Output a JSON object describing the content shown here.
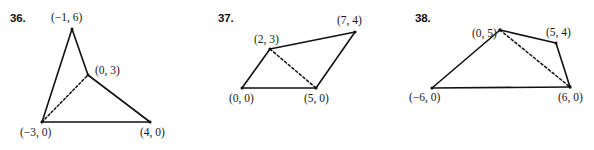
{
  "page": {
    "background_color": "#ffffff",
    "stroke_color": "#111111",
    "text_color": "#1a1a1a",
    "width": 594,
    "height": 150
  },
  "figures": [
    {
      "id": "figure-36",
      "number": "36.",
      "number_pos": {
        "x": 10,
        "y": 13
      },
      "shape": "triangle-with-cevian",
      "vertices": [
        {
          "name": "(-1, 6)",
          "label": "(−1, 6)",
          "px": 72,
          "py": 29,
          "label_x": 51,
          "label_y": 12
        },
        {
          "name": "(0, 3)",
          "label": "(0, 3)",
          "px": 88,
          "py": 75,
          "label_x": 95,
          "label_y": 65
        },
        {
          "name": "(4, 0)",
          "label": "(4, 0)",
          "px": 150,
          "py": 122,
          "label_x": 140,
          "label_y": 127
        },
        {
          "name": "(-3, 0)",
          "label": "(−3, 0)",
          "px": 42,
          "py": 122,
          "label_x": 20,
          "label_y": 127
        }
      ],
      "solid_edges": [
        [
          0,
          1
        ],
        [
          1,
          2
        ],
        [
          2,
          3
        ],
        [
          3,
          0
        ]
      ],
      "dashed_edges": [
        [
          3,
          1
        ]
      ]
    },
    {
      "id": "figure-37",
      "number": "37.",
      "number_pos": {
        "x": 218,
        "y": 13
      },
      "shape": "quadrilateral-with-diagonal",
      "vertices": [
        {
          "name": "(2, 3)",
          "label": "(2, 3)",
          "px": 270,
          "py": 49,
          "label_x": 254,
          "label_y": 34
        },
        {
          "name": "(7, 4)",
          "label": "(7, 4)",
          "px": 355,
          "py": 32,
          "label_x": 337,
          "label_y": 15
        },
        {
          "name": "(5, 0)",
          "label": "(5, 0)",
          "px": 316,
          "py": 88,
          "label_x": 304,
          "label_y": 93
        },
        {
          "name": "(0, 0)",
          "label": "(0, 0)",
          "px": 242,
          "py": 88,
          "label_x": 229,
          "label_y": 93
        }
      ],
      "solid_edges": [
        [
          0,
          1
        ],
        [
          1,
          2
        ],
        [
          2,
          3
        ],
        [
          3,
          0
        ]
      ],
      "dashed_edges": [
        [
          0,
          2
        ]
      ]
    },
    {
      "id": "figure-38",
      "number": "38.",
      "number_pos": {
        "x": 415,
        "y": 13
      },
      "shape": "quadrilateral-with-diagonal",
      "vertices": [
        {
          "name": "(0, 5)",
          "label": "(0, 5)",
          "px": 500,
          "py": 30,
          "label_x": 472,
          "label_y": 28
        },
        {
          "name": "(5, 4)",
          "label": "(5, 4)",
          "px": 556,
          "py": 43,
          "label_x": 546,
          "label_y": 27
        },
        {
          "name": "(6, 0)",
          "label": "(6, 0)",
          "px": 570,
          "py": 87,
          "label_x": 558,
          "label_y": 92
        },
        {
          "name": "(-6, 0)",
          "label": "(−6, 0)",
          "px": 432,
          "py": 88,
          "label_x": 409,
          "label_y": 92
        }
      ],
      "solid_edges": [
        [
          0,
          1
        ],
        [
          1,
          2
        ],
        [
          2,
          3
        ],
        [
          3,
          0
        ]
      ],
      "dashed_edges": [
        [
          0,
          2
        ]
      ]
    }
  ]
}
